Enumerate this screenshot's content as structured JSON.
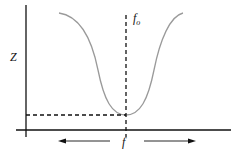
{
  "diagram": {
    "type": "impedance-vs-frequency",
    "y_axis_label": "Z",
    "x_axis_label": "f",
    "resonance_label_main": "f",
    "resonance_label_sub": "o",
    "curve_color": "#9a9a9a",
    "axis_color": "#111111",
    "arrows": [
      "left",
      "right"
    ]
  }
}
